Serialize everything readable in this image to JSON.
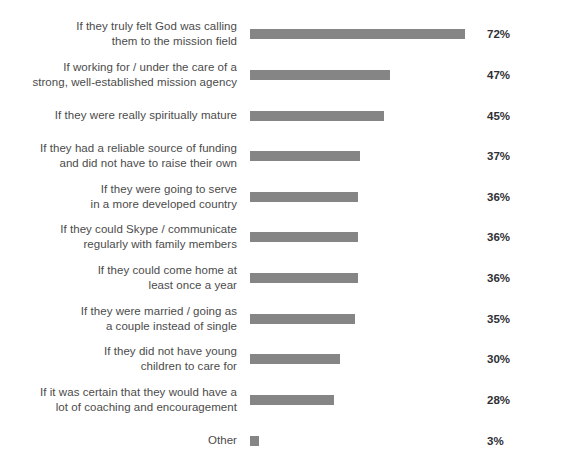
{
  "chart_data": {
    "type": "bar",
    "orientation": "horizontal",
    "title": "",
    "subtitle": "",
    "xlabel": "",
    "ylabel": "",
    "xlim": [
      0,
      72
    ],
    "grid": false,
    "legend": null,
    "value_suffix": "%",
    "bar_color": "#858585",
    "label_color": "#4b4b4b",
    "value_color": "#2f2f35",
    "background": "#ffffff",
    "categories": [
      "If they truly felt God was calling them to the mission field",
      "If working for / under the care of a strong, well-established mission agency",
      "If they were really spiritually mature",
      "If they had a reliable source of funding and did not have to raise their own",
      "If they were going to serve in a more developed country",
      "If they could Skype / communicate regularly with family members",
      "If they could come home at least once a year",
      "If they were married / going as a couple instead of single",
      "If they did not have young children to care for",
      "If it was certain that they would have a lot of coaching and encouragement",
      "Other"
    ],
    "values": [
      72,
      47,
      45,
      37,
      36,
      36,
      36,
      35,
      30,
      28,
      3
    ],
    "value_labels": [
      "72%",
      "47%",
      "45%",
      "37%",
      "36%",
      "36%",
      "36%",
      "35%",
      "30%",
      "28%",
      "3%"
    ],
    "category_lines": [
      [
        "If they truly felt God was calling",
        "them to the mission field"
      ],
      [
        "If working for / under the care of a",
        "strong, well-established mission agency"
      ],
      [
        "If they were really spiritually mature"
      ],
      [
        "If they had a reliable source of funding",
        "and did not have to raise their own"
      ],
      [
        "If they were going to serve",
        "in a more developed country"
      ],
      [
        "If they could Skype / communicate",
        "regularly with family members"
      ],
      [
        "If they could come home at",
        "least once a year"
      ],
      [
        "If they were married / going as",
        "a couple instead of single"
      ],
      [
        "If they did not have young",
        "children to care for"
      ],
      [
        "If it was certain that they would have a",
        "lot of coaching and encouragement"
      ],
      [
        "Other"
      ]
    ]
  }
}
